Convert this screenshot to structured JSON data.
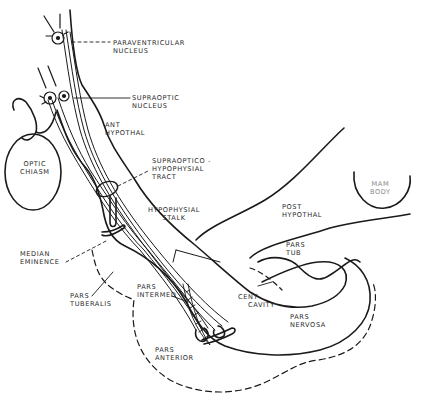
{
  "diagram": {
    "type": "anatomical-line-drawing",
    "line_color": "#1a1a1a",
    "background": "#ffffff"
  },
  "labels": {
    "paraventricular": {
      "line1": "PARAVENTRICULAR",
      "line2": "NUCLEUS"
    },
    "supraoptic": {
      "line1": "SUPRAOPTIC",
      "line2": "NUCLEUS"
    },
    "ant_hypothal": {
      "line1": "ANT",
      "line2": "HYPOTHAL"
    },
    "optic_chiasm": {
      "line1": "OPTIC",
      "line2": "CHIASM"
    },
    "tract": {
      "line1": "SUPRAOPTICO -",
      "line2": "HYPOPHYSIAL",
      "line3": "TRACT"
    },
    "stalk": {
      "line1": "HYPOPHYSIAL",
      "line2": "STALK"
    },
    "post_hypothal": {
      "line1": "POST",
      "line2": "HYPOTHAL"
    },
    "mam_body": {
      "line1": "MAM",
      "line2": "BODY"
    },
    "pars_tub": {
      "line1": "PARS",
      "line2": "TUB"
    },
    "median_eminence": {
      "line1": "MEDIAN",
      "line2": "EMINENCE"
    },
    "pars_tuberalis": {
      "line1": "PARS",
      "line2": "TUBERALIS"
    },
    "pars_intermed": {
      "line1": "PARS",
      "line2": "INTERMED"
    },
    "cent_cavity": {
      "line1": "CENT",
      "line2": "CAVITY"
    },
    "pars_nervosa": {
      "line1": "PARS",
      "line2": "NERVOSA"
    },
    "pars_anterior": {
      "line1": "PARS",
      "line2": "ANTERIOR"
    }
  }
}
